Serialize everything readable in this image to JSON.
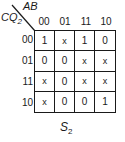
{
  "kmap": {
    "column_variables": "AB",
    "row_variables": "CQ",
    "row_variables_subscript": "2",
    "column_headers": [
      "00",
      "01",
      "11",
      "10"
    ],
    "row_headers": [
      "00",
      "01",
      "11",
      "10"
    ],
    "cells": [
      [
        "1",
        "x",
        "1",
        "0"
      ],
      [
        "0",
        "0",
        "x",
        "x"
      ],
      [
        "x",
        "0",
        "x",
        "x"
      ],
      [
        "x",
        "0",
        "0",
        "1"
      ]
    ],
    "caption": "S",
    "caption_subscript": "2"
  }
}
